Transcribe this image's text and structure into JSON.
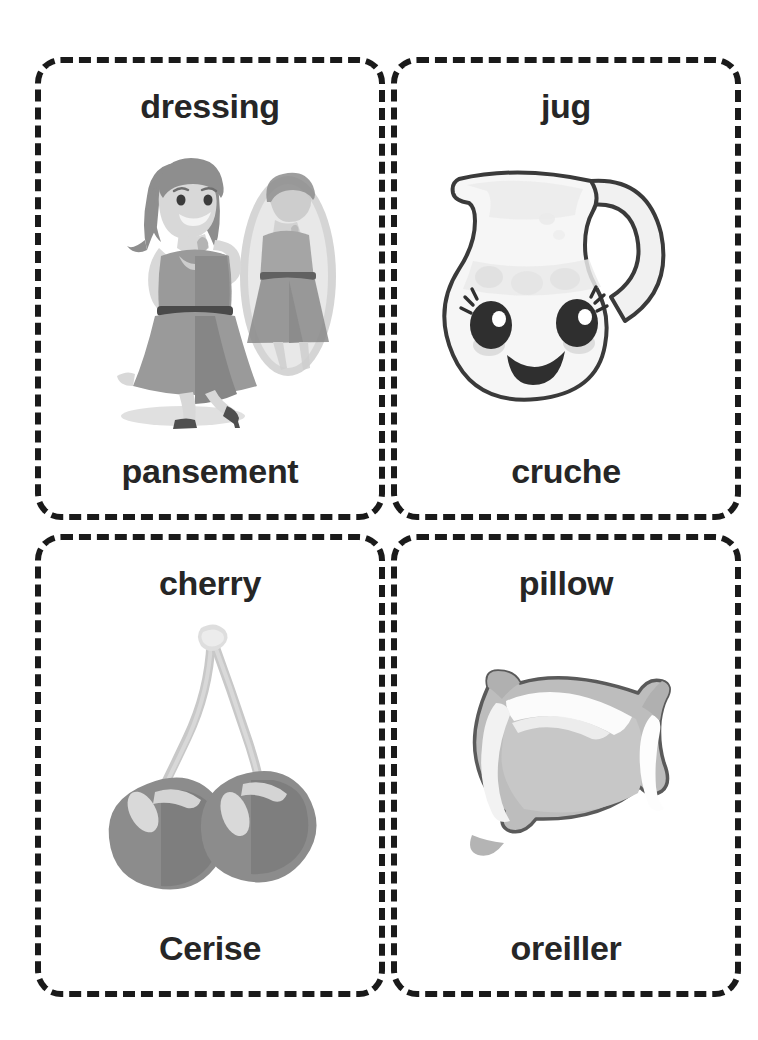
{
  "page": {
    "type": "bilingual-picture-flashcards",
    "language_pair": "English / French",
    "background_color": "#ffffff",
    "border_color": "#1a1a1a",
    "text_color": "#262626"
  },
  "cards": [
    {
      "id": "dressing",
      "english": "dressing",
      "french": "pansement",
      "illustration": "woman-trying-on-dress-in-front-of-mirror-icon",
      "colors": {
        "skin": "#d8d8d8",
        "hair": "#8e8e8e",
        "dress": "#9a9a9a",
        "dress_dark": "#7e7e7e",
        "belt": "#4a4a4a",
        "mirror": "#cfcfcf",
        "shadow": "#dcdcdc"
      }
    },
    {
      "id": "jug",
      "english": "jug",
      "french": "cruche",
      "illustration": "kawaii-jug-with-smiling-face-icon",
      "colors": {
        "body": "#f4f4f4",
        "body_shade": "#e3e3e3",
        "outline": "#3a3a3a",
        "eye": "#333333",
        "blush": "#d6d6d6"
      }
    },
    {
      "id": "cherry",
      "english": "cherry",
      "french": "Cerise",
      "illustration": "pair-of-cherries-with-stems-icon",
      "colors": {
        "fruit": "#8c8c8c",
        "fruit_dark": "#7b7b7b",
        "highlight": "#d9d9d9",
        "stem": "#c8c8c8",
        "stem_dark": "#b0b0b0"
      }
    },
    {
      "id": "pillow",
      "english": "pillow",
      "french": "oreiller",
      "illustration": "soft-pillow-cushion-icon",
      "colors": {
        "fabric": "#b9b9b9",
        "fabric_light": "#e6e6e6",
        "highlight": "#fbfbfb",
        "outline": "#5a5a5a"
      }
    }
  ]
}
